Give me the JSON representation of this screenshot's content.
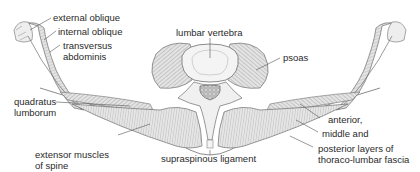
{
  "diagram": {
    "labels": {
      "external_oblique": "external oblique",
      "internal_oblique": "internal oblique",
      "transversus_1": "transversus",
      "transversus_2": "abdominis",
      "lumbar_vertebra": "lumbar vertebra",
      "psoas": "psoas",
      "quadratus_1": "quadratus",
      "quadratus_2": "lumborum",
      "extensor_1": "extensor muscles",
      "extensor_2": "of spine",
      "supraspinous": "supraspinous ligament",
      "fascia_1": "anterior,",
      "fascia_2": "middle and",
      "fascia_3": "posterior layers of",
      "fascia_4": "thoraco-lumbar fascia"
    },
    "colors": {
      "line": "#6e6e6e",
      "muscle_fill": "#d9d9d9",
      "bone_fill": "#f0f0f0",
      "text": "#2a2a2a"
    }
  }
}
